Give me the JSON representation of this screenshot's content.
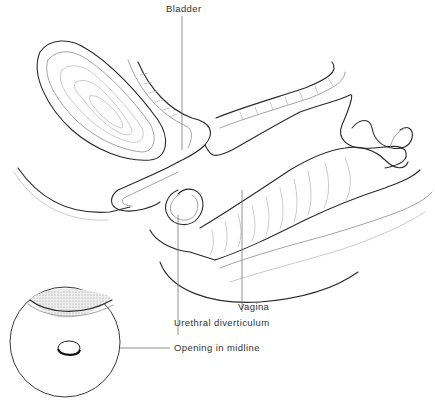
{
  "figure": {
    "type": "anatomical line drawing",
    "colors": {
      "line": "#2a2a2a",
      "label_text": "#333333",
      "stipple": "#d9d9d9"
    }
  },
  "labels": {
    "bladder": "Bladder",
    "vagina": "Vagina",
    "urethral_diverticulum": "Urethral diverticulum",
    "opening_in_midline": "Opening in midline"
  },
  "inset": {
    "description": "circular inset view of anterior vaginal wall",
    "label": "Opening in midline"
  }
}
